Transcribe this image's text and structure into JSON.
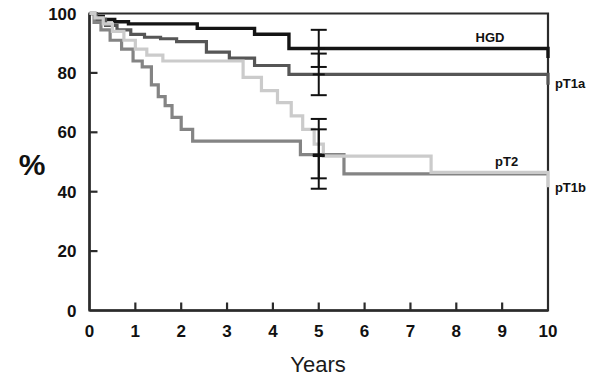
{
  "chart_data": {
    "type": "line",
    "subtype": "kaplan-meier-step",
    "title": "",
    "subtitle": "",
    "xlabel": "Years",
    "ylabel": "%",
    "xlim": [
      0,
      10
    ],
    "ylim": [
      0,
      100
    ],
    "grid": false,
    "legend_position": "inline-right",
    "x_ticks": [
      "0",
      "1",
      "2",
      "3",
      "4",
      "5",
      "6",
      "7",
      "8",
      "9",
      "10"
    ],
    "x_tick_values": [
      0,
      1,
      2,
      3,
      4,
      5,
      6,
      7,
      8,
      9,
      10
    ],
    "y_ticks": [
      "0",
      "20",
      "40",
      "60",
      "80",
      "100"
    ],
    "y_tick_values": [
      0,
      20,
      40,
      60,
      80,
      100
    ],
    "series": [
      {
        "name": "HGD",
        "label": "HGD",
        "color": "#141414",
        "stroke_width": 3.4,
        "label_inside": true,
        "label_x": 9.05,
        "label_y": 92.0,
        "x": [
          0.0,
          0.12,
          0.3,
          0.55,
          0.85,
          1.3,
          2.35,
          3.6,
          4.35,
          7.45,
          10.0
        ],
        "y": [
          100.0,
          99.0,
          98.0,
          97.2,
          96.5,
          96.5,
          95.0,
          93.0,
          88.2,
          88.2,
          85.0
        ]
      },
      {
        "name": "pT1a",
        "label": "pT1a",
        "color": "#565656",
        "stroke_width": 3.2,
        "label_inside": false,
        "label_x": 10.15,
        "label_y": 76.5,
        "x": [
          0.0,
          0.15,
          0.35,
          0.6,
          0.9,
          1.2,
          1.55,
          1.9,
          2.55,
          3.05,
          3.6,
          4.35,
          5.5,
          10.0
        ],
        "y": [
          100.0,
          98.0,
          96.0,
          94.5,
          93.0,
          92.0,
          91.5,
          90.5,
          87.0,
          85.0,
          82.5,
          79.5,
          79.5,
          76.0
        ]
      },
      {
        "name": "pT2",
        "label": "pT2",
        "color": "#848484",
        "stroke_width": 3.2,
        "label_inside": true,
        "label_x": 9.35,
        "label_y": 50.5,
        "x": [
          0.0,
          0.1,
          0.25,
          0.45,
          0.7,
          0.95,
          1.15,
          1.35,
          1.5,
          1.65,
          1.8,
          2.0,
          2.25,
          4.35,
          4.6,
          5.55,
          10.0
        ],
        "y": [
          100.0,
          97.0,
          94.5,
          91.0,
          88.0,
          84.0,
          82.0,
          76.0,
          72.0,
          69.0,
          65.0,
          61.0,
          57.0,
          57.0,
          52.5,
          46.0,
          46.0
        ]
      },
      {
        "name": "pT1b",
        "label": "pT1b",
        "color": "#cbcbcb",
        "stroke_width": 3.2,
        "label_inside": false,
        "label_x": 10.15,
        "label_y": 41.5,
        "x": [
          0.0,
          0.12,
          0.3,
          0.5,
          0.75,
          1.0,
          1.25,
          1.6,
          2.3,
          3.35,
          3.75,
          4.1,
          4.4,
          4.65,
          4.9,
          5.1,
          7.45,
          10.0
        ],
        "y": [
          100.0,
          98.5,
          96.5,
          94.0,
          91.0,
          88.0,
          86.0,
          84.0,
          84.0,
          78.5,
          74.0,
          70.0,
          65.5,
          61.0,
          56.0,
          52.0,
          46.5,
          41.5
        ]
      }
    ],
    "error_bars": [
      {
        "series": "HGD",
        "x": 5.0,
        "y": 88.2,
        "low": 82.0,
        "high": 94.5,
        "color": "#111111"
      },
      {
        "series": "pT1a",
        "x": 5.0,
        "y": 79.5,
        "low": 72.5,
        "high": 86.5,
        "color": "#111111"
      },
      {
        "series": "pT1b",
        "x": 5.0,
        "y": 52.0,
        "low": 41.0,
        "high": 64.5,
        "color": "#111111"
      },
      {
        "series": "pT2",
        "x": 5.0,
        "y": 52.5,
        "low": 44.5,
        "high": 61.0,
        "color": "#111111"
      }
    ],
    "annotations": []
  },
  "axis": {
    "y_axis_title": "%",
    "x_axis_title": "Years"
  }
}
